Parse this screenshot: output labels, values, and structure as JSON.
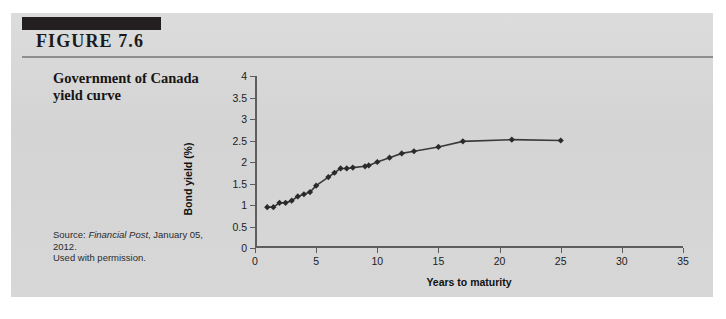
{
  "figure": {
    "label": "FIGURE 7.6",
    "caption": "Government of Canada yield curve",
    "source_prefix": "Source: ",
    "source_publication": "Financial Post",
    "source_date": ", January 05, 2012.",
    "source_permission": "Used with permission.",
    "panel_color": "#d6d6d6",
    "rule_color": "#8e8e8e",
    "bar_color": "#231f20"
  },
  "chart_data": {
    "type": "line",
    "title": "Government of Canada yield curve",
    "xlabel": "Years to maturity",
    "ylabel": "Bond yield (%)",
    "xlim": [
      0,
      35
    ],
    "ylim": [
      0,
      4
    ],
    "xticks": [
      0,
      5,
      10,
      15,
      20,
      25,
      30,
      35
    ],
    "yticks": [
      0,
      0.5,
      1,
      1.5,
      2,
      2.5,
      3,
      3.5,
      4
    ],
    "xtick_labels": [
      "0",
      "5",
      "10",
      "15",
      "20",
      "25",
      "30",
      "35"
    ],
    "ytick_labels": [
      "0",
      "0.5",
      "1",
      "1.5",
      "2",
      "2.5",
      "3",
      "3.5",
      "4"
    ],
    "grid": false,
    "legend": false,
    "marker": "diamond",
    "line_color": "#3a3a3a",
    "marker_color": "#2a2a2a",
    "series": [
      {
        "name": "Government of Canada yield curve",
        "x": [
          1.0,
          1.5,
          2.0,
          2.5,
          3.0,
          3.5,
          4.0,
          4.5,
          5.0,
          6.0,
          6.5,
          7.0,
          7.5,
          8.0,
          9.0,
          9.3,
          10.0,
          11.0,
          12.0,
          13.0,
          15.0,
          17.0,
          21.0,
          25.0
        ],
        "y": [
          0.95,
          0.95,
          1.05,
          1.05,
          1.1,
          1.2,
          1.25,
          1.3,
          1.45,
          1.65,
          1.75,
          1.85,
          1.85,
          1.87,
          1.9,
          1.92,
          2.0,
          2.1,
          2.2,
          2.25,
          2.35,
          2.48,
          2.52,
          2.5
        ]
      }
    ]
  }
}
